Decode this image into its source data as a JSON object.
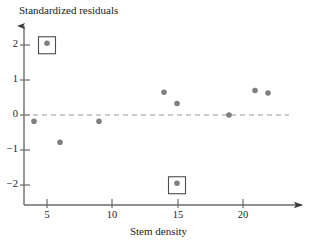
{
  "chart_data": {
    "type": "scatter",
    "title": "",
    "xlabel": "Stem density",
    "ylabel": "Standardized residuals",
    "xlim": [
      2.4,
      24.0
    ],
    "ylim": [
      -2.55,
      2.55
    ],
    "grid": false,
    "legend": null,
    "zero_reference_line": {
      "y": 0,
      "style": "dashed",
      "color": "#9a9a9a"
    },
    "x_ticks": [
      5,
      10,
      15,
      20
    ],
    "y_ticks": [
      2,
      1,
      0,
      -1,
      -2
    ],
    "x_tick_labels": [
      "5",
      "10",
      "15",
      "20"
    ],
    "y_tick_labels": [
      "2",
      "1",
      "0",
      "−1",
      "−2"
    ],
    "point_color": "#7f7f7f",
    "point_radius": 2.8,
    "points": [
      {
        "x": 4,
        "y": -0.18,
        "highlighted": false
      },
      {
        "x": 5,
        "y": 2.05,
        "highlighted": true
      },
      {
        "x": 6,
        "y": -0.78,
        "highlighted": false
      },
      {
        "x": 9,
        "y": -0.18,
        "highlighted": false
      },
      {
        "x": 14,
        "y": 0.65,
        "highlighted": false
      },
      {
        "x": 15,
        "y": 0.33,
        "highlighted": false
      },
      {
        "x": 15,
        "y": -1.95,
        "highlighted": true
      },
      {
        "x": 19,
        "y": 0.0,
        "highlighted": false
      },
      {
        "x": 21,
        "y": 0.7,
        "highlighted": false
      },
      {
        "x": 22,
        "y": 0.63,
        "highlighted": false
      }
    ],
    "highlight_box": {
      "stroke": "#4d4d4d",
      "fill": "none",
      "size": 17
    },
    "axis_color": "#6b6b6b",
    "axis_arrow": true
  }
}
